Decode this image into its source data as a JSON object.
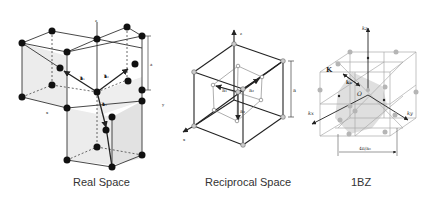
{
  "panels": [
    {
      "id": "real-space",
      "caption": "Real Space",
      "labels": {
        "z": "z",
        "x": "x",
        "y": "y",
        "a": "a",
        "a1": "a⃗₁",
        "a2": "a⃗₂",
        "a3": "a⃗₃"
      }
    },
    {
      "id": "reciprocal-space",
      "caption": "Reciprocal Space",
      "labels": {
        "z": "z",
        "x": "x",
        "y": "y",
        "a": "a",
        "a1": "a₁",
        "a2": "a₂",
        "a3": "a₃"
      }
    },
    {
      "id": "first-brillouin-zone",
      "caption": "1BZ",
      "labels": {
        "kz": "kₓ",
        "kz_label": "kz",
        "kx": "kx",
        "ky": "ky",
        "K": "K",
        "k0": "k₀",
        "origin": "O",
        "width": "4π/a₀"
      }
    }
  ],
  "colors": {
    "line": "#333333",
    "node": "#111111",
    "face": "#e6e6e6",
    "bz_node": "#b5b5b5",
    "bz_line": "#999999"
  }
}
